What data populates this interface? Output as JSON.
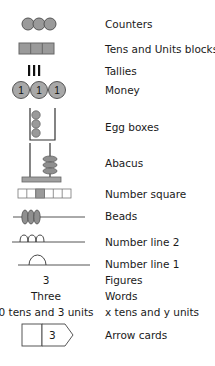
{
  "rows": [
    {
      "id": "counters",
      "label": "Counters"
    },
    {
      "id": "tens_units_blocks",
      "label": "Tens and Units blocks"
    },
    {
      "id": "tallies",
      "label": "Tallies"
    },
    {
      "id": "money",
      "label": "Money",
      "coin_value": "1"
    },
    {
      "id": "egg_boxes",
      "label": "Egg boxes"
    },
    {
      "id": "abacus",
      "label": "Abacus"
    },
    {
      "id": "number_square",
      "label": "Number square"
    },
    {
      "id": "beads",
      "label": "Beads"
    },
    {
      "id": "number_line_2",
      "label": "Number line 2"
    },
    {
      "id": "number_line_1",
      "label": "Number line 1"
    },
    {
      "id": "figures",
      "label": "Figures",
      "example": "3"
    },
    {
      "id": "words",
      "label": "Words",
      "example": "Three"
    },
    {
      "id": "tens_and_units",
      "label": "x tens and y units",
      "example": "0 tens and 3 units"
    },
    {
      "id": "arrow_cards",
      "label": "Arrow cards",
      "card_value": "3"
    }
  ],
  "colors": {
    "fill_gray": "#9a9a9a",
    "stroke": "#333333",
    "square_highlight": "#9a9a9a",
    "line": "#555555"
  }
}
